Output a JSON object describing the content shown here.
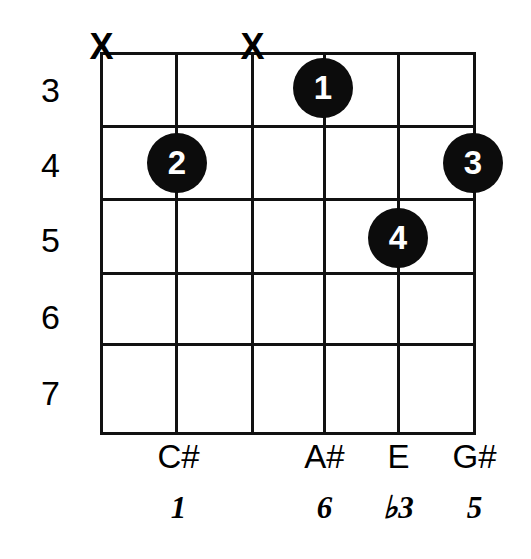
{
  "diagram": {
    "type": "guitar-chord-diagram",
    "title": "",
    "background_color": "#ffffff",
    "line_color": "#111111",
    "dot_color": "#0c0c0c",
    "dot_text_color": "#ffffff",
    "string_count": 6,
    "fret_count": 5
  },
  "fret_numbers": [
    {
      "label": "3",
      "y": 90
    },
    {
      "label": "4",
      "y": 165
    },
    {
      "label": "5",
      "y": 240
    },
    {
      "label": "6",
      "y": 317
    },
    {
      "label": "7",
      "y": 393
    }
  ],
  "strings": [
    {
      "index": 1,
      "x": 100,
      "muted": true,
      "note": "",
      "interval": ""
    },
    {
      "index": 2,
      "x": 175,
      "muted": false,
      "note": "C#",
      "interval": "1"
    },
    {
      "index": 3,
      "x": 251,
      "muted": true,
      "note": "",
      "interval": ""
    },
    {
      "index": 4,
      "x": 323,
      "muted": false,
      "note": "A#",
      "interval": "6"
    },
    {
      "index": 5,
      "x": 397,
      "muted": false,
      "note": "E",
      "interval": "♭3"
    },
    {
      "index": 6,
      "x": 473,
      "muted": false,
      "note": "G#",
      "interval": "5"
    }
  ],
  "fret_lines_y": [
    52,
    125,
    198,
    272,
    343,
    432
  ],
  "mute_markers": [
    {
      "label": "X",
      "string": 1,
      "x": 100,
      "y": 47
    },
    {
      "label": "X",
      "string": 3,
      "x": 251,
      "y": 47
    }
  ],
  "finger_dots": [
    {
      "label": "1",
      "string": 4,
      "fret": 3,
      "x": 323,
      "y": 88
    },
    {
      "label": "2",
      "string": 2,
      "fret": 4,
      "x": 177,
      "y": 163
    },
    {
      "label": "3",
      "string": 6,
      "fret": 4,
      "x": 473,
      "y": 163
    },
    {
      "label": "4",
      "string": 5,
      "fret": 5,
      "x": 398,
      "y": 238
    }
  ],
  "note_labels": [
    {
      "text": "C#",
      "x": 177,
      "y": 440
    },
    {
      "text": "A#",
      "x": 323,
      "y": 440
    },
    {
      "text": "E",
      "x": 397,
      "y": 440
    },
    {
      "text": "G#",
      "x": 473,
      "y": 440
    }
  ],
  "interval_labels": [
    {
      "text": "1",
      "x": 177,
      "y": 492
    },
    {
      "text": "6",
      "x": 323,
      "y": 492
    },
    {
      "text": "♭3",
      "x": 397,
      "y": 492
    },
    {
      "text": "5",
      "x": 473,
      "y": 492
    }
  ]
}
